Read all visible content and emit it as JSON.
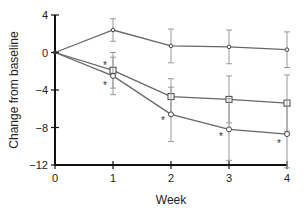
{
  "chart_data": {
    "type": "line",
    "title": "",
    "xlabel": "Week",
    "ylabel": "Change from baseline",
    "x": [
      0,
      1,
      2,
      3,
      4
    ],
    "x_tick_labels": [
      "0",
      "1",
      "2",
      "3",
      "4"
    ],
    "y_tick_labels": [
      "4",
      "0",
      "−4",
      "−8",
      "−12"
    ],
    "y_ticks": [
      4,
      0,
      -4,
      -8,
      -12
    ],
    "xlim": [
      0,
      4
    ],
    "ylim": [
      -12,
      4
    ],
    "grid": false,
    "legend": null,
    "series": [
      {
        "name": "Series A (small circle, top)",
        "marker": "small-circle",
        "values": [
          0,
          2.4,
          0.7,
          0.6,
          0.3
        ],
        "error": [
          0,
          1.2,
          1.8,
          1.8,
          1.9
        ]
      },
      {
        "name": "Series B (open square)",
        "marker": "open-square",
        "values": [
          0,
          -1.9,
          -4.7,
          -5.0,
          -5.4
        ],
        "error": [
          0,
          1.9,
          1.9,
          2.5,
          3.0
        ]
      },
      {
        "name": "Series C (open circle)",
        "marker": "open-circle",
        "values": [
          0,
          -2.5,
          -6.6,
          -8.2,
          -8.7
        ],
        "error": [
          0,
          2.0,
          2.9,
          3.3,
          3.6
        ]
      }
    ],
    "annotations": [
      {
        "text": "*",
        "x": 1,
        "y": -1.3,
        "note": "above week 1 square"
      },
      {
        "text": "*",
        "x": 1,
        "y": -3.5,
        "note": "below week 1 circle"
      },
      {
        "text": "*",
        "x": 2,
        "y": -7.2
      },
      {
        "text": "*",
        "x": 3,
        "y": -8.9
      },
      {
        "text": "*",
        "x": 4,
        "y": -9.7
      }
    ]
  }
}
